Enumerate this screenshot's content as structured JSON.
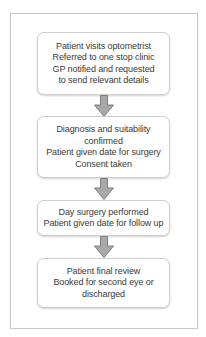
{
  "diagram": {
    "type": "flowchart",
    "direction": "top-to-bottom",
    "colors": {
      "frame_border": "#c8c8c8",
      "box_border": "#cfcfcf",
      "box_fill": "#ffffff",
      "text": "#3a3a3a",
      "arrow_fill": "#a9a9a9",
      "arrow_stroke": "#7f7f7f"
    },
    "steps": [
      {
        "lines": [
          "Patient visits optometrist",
          "Referred to one stop clinic",
          "GP notified and requested",
          "to send relevant details"
        ]
      },
      {
        "lines": [
          "Diagnosis and suitability",
          "confirmed",
          "Patient given date for surgery",
          "Consent taken"
        ]
      },
      {
        "lines": [
          "Day surgery performed",
          "Patient given date for follow up"
        ]
      },
      {
        "lines": [
          "Patient final review",
          "Booked for second eye or",
          "discharged"
        ]
      }
    ],
    "arrows": [
      {
        "from": 0,
        "to": 1,
        "icon": "down-arrow-icon"
      },
      {
        "from": 1,
        "to": 2,
        "icon": "down-arrow-icon"
      },
      {
        "from": 2,
        "to": 3,
        "icon": "down-arrow-icon"
      }
    ]
  }
}
